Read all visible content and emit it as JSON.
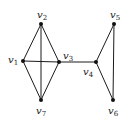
{
  "diagram": {
    "type": "graph",
    "directed": false,
    "nodes": [
      {
        "id": "v1",
        "base": "v",
        "sub": "1",
        "x": 23,
        "y": 61,
        "label_x": 8,
        "label_y": 55
      },
      {
        "id": "v2",
        "base": "v",
        "sub": "2",
        "x": 41,
        "y": 24,
        "label_x": 37,
        "label_y": 10
      },
      {
        "id": "v3",
        "base": "v",
        "sub": "3",
        "x": 59,
        "y": 62,
        "label_x": 63,
        "label_y": 51
      },
      {
        "id": "v4",
        "base": "v",
        "sub": "4",
        "x": 96,
        "y": 62,
        "label_x": 83,
        "label_y": 67
      },
      {
        "id": "v5",
        "base": "v",
        "sub": "5",
        "x": 114,
        "y": 24,
        "label_x": 110,
        "label_y": 10
      },
      {
        "id": "v6",
        "base": "v",
        "sub": "6",
        "x": 113,
        "y": 100,
        "label_x": 108,
        "label_y": 106
      },
      {
        "id": "v7",
        "base": "v",
        "sub": "7",
        "x": 41,
        "y": 100,
        "label_x": 36,
        "label_y": 106
      }
    ],
    "edges": [
      [
        "v1",
        "v2"
      ],
      [
        "v1",
        "v3"
      ],
      [
        "v1",
        "v7"
      ],
      [
        "v2",
        "v3"
      ],
      [
        "v2",
        "v7"
      ],
      [
        "v3",
        "v7"
      ],
      [
        "v3",
        "v4"
      ],
      [
        "v4",
        "v5"
      ],
      [
        "v4",
        "v6"
      ],
      [
        "v5",
        "v6"
      ]
    ],
    "colors": {
      "edge": "#1a1a1a",
      "node": "#111111",
      "label": "#222222",
      "background": "#ffffff"
    }
  },
  "labels": {
    "v1": {
      "base": "v",
      "sub": "1"
    },
    "v2": {
      "base": "v",
      "sub": "2"
    },
    "v3": {
      "base": "v",
      "sub": "3"
    },
    "v4": {
      "base": "v",
      "sub": "4"
    },
    "v5": {
      "base": "v",
      "sub": "5"
    },
    "v6": {
      "base": "v",
      "sub": "6"
    },
    "v7": {
      "base": "v",
      "sub": "7"
    }
  }
}
